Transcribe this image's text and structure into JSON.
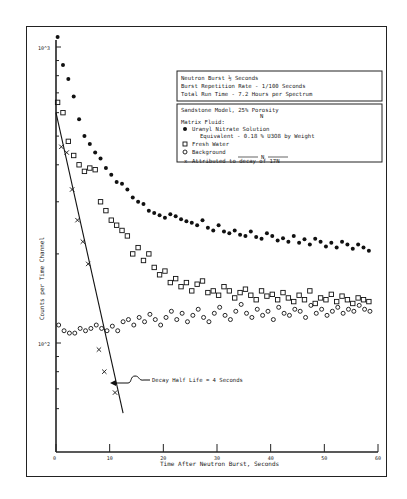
{
  "info_box": {
    "lines": [
      "Neutron Burst  ½ Seconds",
      "Burst Repetition Rate - 1/100 Seconds",
      "Total Run Time - 7.2 Hours per Spectrum"
    ]
  },
  "legend": {
    "title": "Sandstone Model, 25% Porosity",
    "title_sub": "N",
    "matrix_label": "Matrix Fluid:",
    "entries": [
      {
        "marker": "filled-circle",
        "label": "Uranyl Nitrate Solution",
        "label2": "Equivalent - 0.18 % U3O8 by Weight"
      },
      {
        "marker": "square",
        "label": "Fresh Water"
      },
      {
        "marker": "open-circle",
        "label": "Background"
      },
      {
        "marker": "x",
        "label": "Attributed to decay of 17N"
      }
    ],
    "divider_label": "N"
  },
  "annotation": "Decay Half Life = 4 Seconds",
  "chart_data": {
    "type": "scatter",
    "title": "",
    "xlabel": "Time After Neutron Burst, Seconds",
    "ylabel": "Counts per Time Channel",
    "y_scale": "log",
    "y_ticks": [
      "10^2",
      "10^3"
    ],
    "x_ticks": [
      "0",
      "10",
      "20",
      "30",
      "40",
      "50",
      "60"
    ],
    "xlim": [
      0,
      60
    ],
    "ylim": [
      60,
      1100
    ],
    "grid": false,
    "legend_position": "upper right (boxed)",
    "series": [
      {
        "name": "Uranyl Nitrate Solution",
        "marker": "filled-circle",
        "points": [
          [
            0.3,
            1080
          ],
          [
            1.3,
            870
          ],
          [
            2.3,
            780
          ],
          [
            3.3,
            680
          ],
          [
            4.3,
            570
          ],
          [
            5.3,
            500
          ],
          [
            6.3,
            470
          ],
          [
            7.3,
            440
          ],
          [
            8.3,
            420
          ],
          [
            9.3,
            390
          ],
          [
            10.3,
            370
          ],
          [
            11.3,
            350
          ],
          [
            12.3,
            345
          ],
          [
            13.3,
            330
          ],
          [
            14.3,
            310
          ],
          [
            15.3,
            300
          ],
          [
            16.3,
            295
          ],
          [
            17.3,
            280
          ],
          [
            18.3,
            275
          ],
          [
            19.3,
            270
          ],
          [
            20.3,
            265
          ],
          [
            21.3,
            272
          ],
          [
            22.3,
            268
          ],
          [
            23.3,
            262
          ],
          [
            24.3,
            258
          ],
          [
            25.3,
            255
          ],
          [
            26.3,
            250
          ],
          [
            27.3,
            260
          ],
          [
            28.3,
            245
          ],
          [
            29.3,
            240
          ],
          [
            30.3,
            250
          ],
          [
            31.3,
            238
          ],
          [
            32.3,
            235
          ],
          [
            33.3,
            240
          ],
          [
            34.3,
            232
          ],
          [
            35.3,
            230
          ],
          [
            36.3,
            238
          ],
          [
            37.3,
            228
          ],
          [
            38.3,
            225
          ],
          [
            39.3,
            235
          ],
          [
            40.3,
            230
          ],
          [
            41.3,
            222
          ],
          [
            42.3,
            226
          ],
          [
            43.3,
            220
          ],
          [
            44.3,
            230
          ],
          [
            45.3,
            218
          ],
          [
            46.3,
            224
          ],
          [
            47.3,
            215
          ],
          [
            48.3,
            225
          ],
          [
            49.3,
            220
          ],
          [
            50.3,
            212
          ],
          [
            51.3,
            218
          ],
          [
            52.3,
            210
          ],
          [
            53.3,
            220
          ],
          [
            54.3,
            215
          ],
          [
            55.3,
            208
          ],
          [
            56.3,
            215
          ],
          [
            57.3,
            210
          ],
          [
            58.3,
            205
          ]
        ]
      },
      {
        "name": "Fresh Water",
        "marker": "square",
        "points": [
          [
            0.3,
            650
          ],
          [
            1.3,
            600
          ],
          [
            2.3,
            480
          ],
          [
            3.3,
            430
          ],
          [
            4.3,
            400
          ],
          [
            5.3,
            380
          ],
          [
            6.3,
            390
          ],
          [
            7.3,
            385
          ],
          [
            8.3,
            300
          ],
          [
            9.3,
            280
          ],
          [
            10.3,
            260
          ],
          [
            11.3,
            250
          ],
          [
            12.3,
            240
          ],
          [
            13.3,
            230
          ],
          [
            14.3,
            200
          ],
          [
            15.3,
            210
          ],
          [
            16.3,
            190
          ],
          [
            17.3,
            200
          ],
          [
            18.3,
            180
          ],
          [
            19.3,
            170
          ],
          [
            20.3,
            175
          ],
          [
            21.3,
            160
          ],
          [
            22.3,
            165
          ],
          [
            23.3,
            155
          ],
          [
            24.3,
            160
          ],
          [
            25.3,
            150
          ],
          [
            26.3,
            158
          ],
          [
            27.3,
            162
          ],
          [
            28.3,
            148
          ],
          [
            29.3,
            150
          ],
          [
            30.3,
            145
          ],
          [
            31.3,
            155
          ],
          [
            32.3,
            150
          ],
          [
            33.3,
            142
          ],
          [
            34.3,
            148
          ],
          [
            35.3,
            152
          ],
          [
            36.3,
            145
          ],
          [
            37.3,
            140
          ],
          [
            38.3,
            150
          ],
          [
            39.3,
            144
          ],
          [
            40.3,
            146
          ],
          [
            41.3,
            140
          ],
          [
            42.3,
            148
          ],
          [
            43.3,
            142
          ],
          [
            44.3,
            138
          ],
          [
            45.3,
            145
          ],
          [
            46.3,
            140
          ],
          [
            47.3,
            150
          ],
          [
            48.3,
            136
          ],
          [
            49.3,
            142
          ],
          [
            50.3,
            140
          ],
          [
            51.3,
            146
          ],
          [
            52.3,
            138
          ],
          [
            53.3,
            144
          ],
          [
            54.3,
            140
          ],
          [
            55.3,
            136
          ],
          [
            56.3,
            142
          ],
          [
            57.3,
            140
          ],
          [
            58.3,
            138
          ]
        ]
      },
      {
        "name": "Background",
        "marker": "open-circle",
        "points": [
          [
            0.5,
            115
          ],
          [
            1.5,
            110
          ],
          [
            2.5,
            108
          ],
          [
            3.5,
            108
          ],
          [
            4.5,
            112
          ],
          [
            5.5,
            110
          ],
          [
            6.5,
            112
          ],
          [
            7.5,
            115
          ],
          [
            8.5,
            112
          ],
          [
            9.5,
            110
          ],
          [
            10.5,
            114
          ],
          [
            11.5,
            110
          ],
          [
            12.5,
            118
          ],
          [
            13.5,
            120
          ],
          [
            14.5,
            115
          ],
          [
            15.5,
            122
          ],
          [
            16.5,
            118
          ],
          [
            17.5,
            125
          ],
          [
            18.5,
            120
          ],
          [
            19.5,
            115
          ],
          [
            20.5,
            122
          ],
          [
            21.5,
            128
          ],
          [
            22.5,
            120
          ],
          [
            23.5,
            126
          ],
          [
            24.5,
            118
          ],
          [
            25.5,
            124
          ],
          [
            26.5,
            130
          ],
          [
            27.5,
            122
          ],
          [
            28.5,
            118
          ],
          [
            29.5,
            126
          ],
          [
            30.5,
            132
          ],
          [
            31.5,
            124
          ],
          [
            32.5,
            120
          ],
          [
            33.5,
            128
          ],
          [
            34.5,
            135
          ],
          [
            35.5,
            126
          ],
          [
            36.5,
            122
          ],
          [
            37.5,
            130
          ],
          [
            38.5,
            124
          ],
          [
            39.5,
            128
          ],
          [
            40.5,
            120
          ],
          [
            41.5,
            132
          ],
          [
            42.5,
            126
          ],
          [
            43.5,
            124
          ],
          [
            44.5,
            130
          ],
          [
            45.5,
            128
          ],
          [
            46.5,
            122
          ],
          [
            47.5,
            134
          ],
          [
            48.5,
            126
          ],
          [
            49.5,
            130
          ],
          [
            50.5,
            124
          ],
          [
            51.5,
            128
          ],
          [
            52.5,
            132
          ],
          [
            53.5,
            126
          ],
          [
            54.5,
            130
          ],
          [
            55.5,
            128
          ],
          [
            56.5,
            134
          ],
          [
            57.5,
            130
          ],
          [
            58.5,
            128
          ]
        ]
      },
      {
        "name": "Attributed to decay of 17N",
        "marker": "x",
        "points": [
          [
            1,
            460
          ],
          [
            2,
            440
          ],
          [
            3,
            330
          ],
          [
            4,
            260
          ],
          [
            5,
            220
          ],
          [
            6,
            185
          ],
          [
            8,
            95
          ],
          [
            9,
            80
          ],
          [
            11,
            68
          ]
        ]
      }
    ],
    "fit_line": {
      "description": "Decay half life 4 s",
      "from": [
        0,
        600
      ],
      "to": [
        12.5,
        58
      ]
    }
  }
}
